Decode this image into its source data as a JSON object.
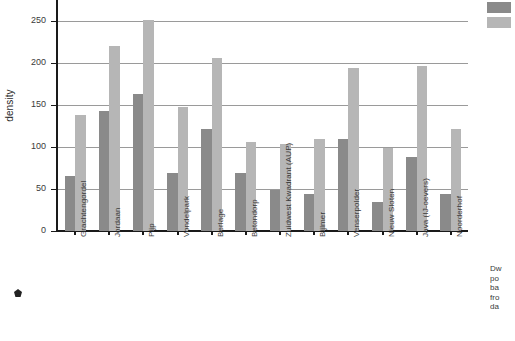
{
  "chart_data": {
    "type": "bar",
    "title": "",
    "xlabel": "",
    "ylabel": "density",
    "ylim": [
      0,
      275
    ],
    "yticks": [
      0,
      50,
      100,
      150,
      200,
      250
    ],
    "ytick_labels": [
      "0",
      "50",
      "100",
      "150",
      "200",
      "250"
    ],
    "grid": true,
    "grid_axis": "y",
    "legend_position": "top-right",
    "categories": [
      "Grachtengordel",
      "Jordaan",
      "Pijp",
      "Vondelpark",
      "Berlage",
      "Betondorp",
      "Zuidwest Kwadrant (AUP)",
      "Bijlmer",
      "Venserpolder",
      "Nieuw Sloten",
      "Java (IJ-oevers)",
      "Noorderhof"
    ],
    "series": [
      {
        "name": "series-1",
        "color": "#8a8a8a",
        "values": [
          65,
          143,
          163,
          69,
          121,
          69,
          49,
          44,
          110,
          34,
          88,
          44
        ]
      },
      {
        "name": "series-2",
        "color": "#b6b6b6",
        "values": [
          138,
          220,
          251,
          148,
          206,
          106,
          104,
          110,
          194,
          99,
          197,
          122
        ]
      }
    ]
  },
  "legend": {
    "swatches": [
      {
        "name": "legend-swatch-dark",
        "color": "#8a8a8a"
      },
      {
        "name": "legend-swatch-light",
        "color": "#b6b6b6"
      }
    ],
    "caption_lines": [
      "Dw",
      "po",
      "ba",
      "fro",
      "da"
    ]
  },
  "marker": {
    "name": "pentagon-marker"
  }
}
